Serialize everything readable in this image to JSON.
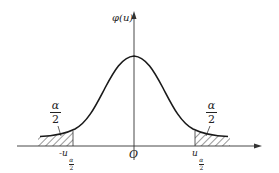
{
  "diagram": {
    "y_axis_label": "φ(u)",
    "origin_label": "O",
    "left_critical_label": {
      "prefix": "-u",
      "sub_num": "α",
      "sub_den": "2"
    },
    "right_critical_label": {
      "prefix": "u",
      "sub_num": "α",
      "sub_den": "2"
    },
    "left_tail_area": {
      "num": "α",
      "den": "2"
    },
    "right_tail_area": {
      "num": "α",
      "den": "2"
    },
    "colors": {
      "ink": "#222222",
      "background": "#ffffff"
    }
  }
}
